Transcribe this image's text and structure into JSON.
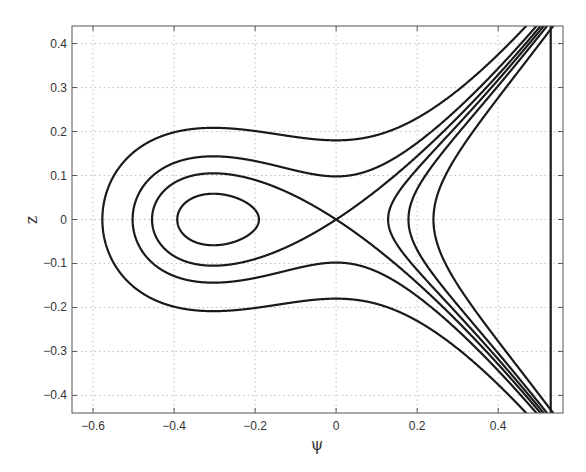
{
  "chart_data": {
    "type": "line",
    "title": "",
    "xlabel": "ψ",
    "ylabel": "z",
    "xlim": [
      -0.652,
      0.56
    ],
    "ylim": [
      -0.44,
      0.44
    ],
    "grid": true,
    "legend": null,
    "x_ticks": [
      -0.6,
      -0.4,
      -0.2,
      0,
      0.2,
      0.4
    ],
    "x_tick_labels": [
      "-0.6",
      "-0.4",
      "-0.2",
      "0",
      "0.2",
      "0.4"
    ],
    "y_ticks": [
      0.4,
      0.3,
      0.2,
      0.1,
      0,
      -0.1,
      -0.2,
      -0.3,
      -0.4
    ],
    "y_tick_labels": [
      "0.4",
      "0.3",
      "0.2",
      "0.1",
      "0",
      "-0.1",
      "-0.2",
      "-0.3",
      "-0.4"
    ],
    "model": {
      "a": 1.19,
      "b": 0.303
    },
    "series": [
      {
        "name": "inner closed orbit",
        "energy": -0.0038,
        "kind": "closed",
        "psi_range": [
          -0.39,
          -0.188
        ],
        "z_max": 0.058
      },
      {
        "name": "separatrix",
        "energy": 0.0,
        "kind": "separatrix",
        "psi_left_crossing": -0.454,
        "z_at_psi_-0.3": 0.105
      },
      {
        "name": "outer orbit 1",
        "energy": 0.0048,
        "kind": "open",
        "psi_left_crossing": -0.506,
        "z_at_psi_0": 0.098
      },
      {
        "name": "outer orbit 2",
        "energy": 0.0162,
        "kind": "open",
        "psi_left_crossing": -0.58,
        "z_at_psi_0": 0.18
      },
      {
        "name": "right branch 1",
        "energy": -0.008,
        "kind": "open-right",
        "psi_vertex": 0.178
      },
      {
        "name": "right branch 2",
        "energy": -0.0159,
        "kind": "open-right",
        "psi_vertex": 0.24
      }
    ],
    "key_points": {
      "center": [
        -0.3,
        0
      ],
      "saddle": [
        0,
        0
      ]
    }
  },
  "style": {
    "line_color": "#1a1a1a",
    "axis_color": "#555555",
    "grid_color": "#b0b0b0",
    "plot_area": {
      "left": 72,
      "top": 26,
      "right": 563,
      "bottom": 413
    }
  }
}
